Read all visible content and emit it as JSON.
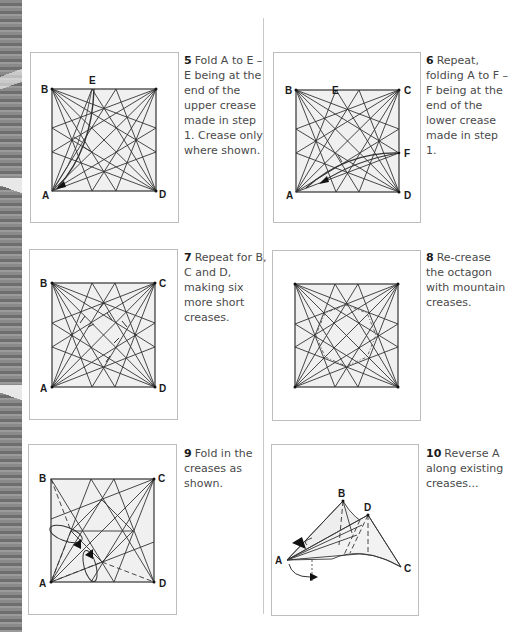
{
  "page": {
    "background": "#ffffff",
    "diagram_fill": "#f0f0f0",
    "line_color": "#333333",
    "frame_color": "#bdbdbd"
  },
  "steps": [
    {
      "number": "5",
      "text": "Fold A to E – E being at the end of the upper crease made in step 1. Crease only where shown.",
      "labels": {
        "A": "A",
        "B": "B",
        "D": "D",
        "E": "E"
      }
    },
    {
      "number": "6",
      "text": "Repeat, folding A to F – F being at the end of the lower crease made in step 1.",
      "labels": {
        "A": "A",
        "B": "B",
        "C": "C",
        "D": "D",
        "E": "E",
        "F": "F"
      }
    },
    {
      "number": "7",
      "text": "Repeat for B, C and D, making six more short creases.",
      "labels": {
        "A": "A",
        "B": "B",
        "C": "C",
        "D": "D"
      }
    },
    {
      "number": "8",
      "text": "Re-crease the octagon with mountain creases.",
      "labels": {}
    },
    {
      "number": "9",
      "text": "Fold in the creases as shown.",
      "labels": {
        "A": "A",
        "B": "B",
        "C": "C",
        "D": "D"
      }
    },
    {
      "number": "10",
      "text": "Reverse A along existing creases...",
      "labels": {
        "A": "A",
        "B": "B",
        "C": "C",
        "D": "D"
      }
    }
  ]
}
